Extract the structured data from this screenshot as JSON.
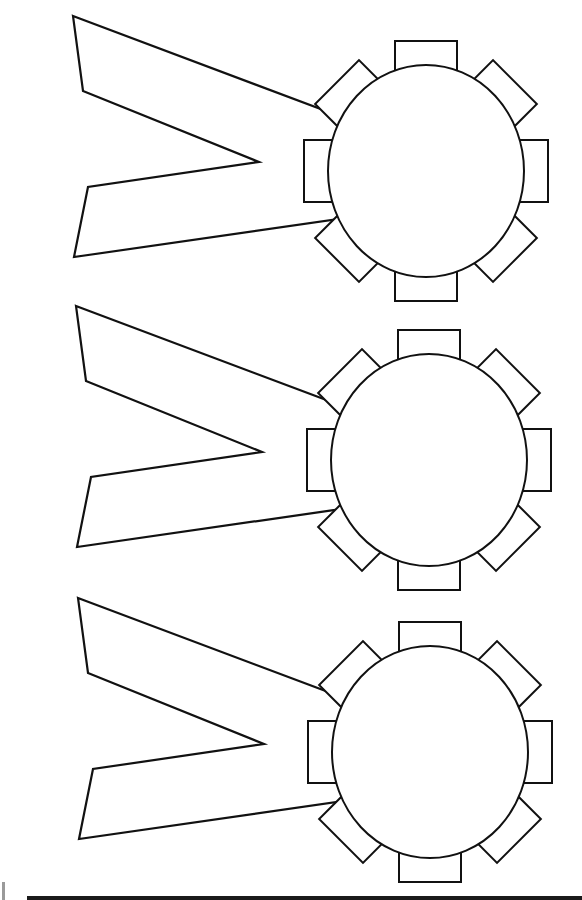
{
  "page": {
    "colors": {
      "line": "#111111",
      "paper": "#ffffff",
      "rule": "#1a1a1a"
    }
  },
  "badges": [
    {
      "name": "ribbon-badge-1",
      "tabs": 8
    },
    {
      "name": "ribbon-badge-2",
      "tabs": 8
    },
    {
      "name": "ribbon-badge-3",
      "tabs": 8
    }
  ]
}
